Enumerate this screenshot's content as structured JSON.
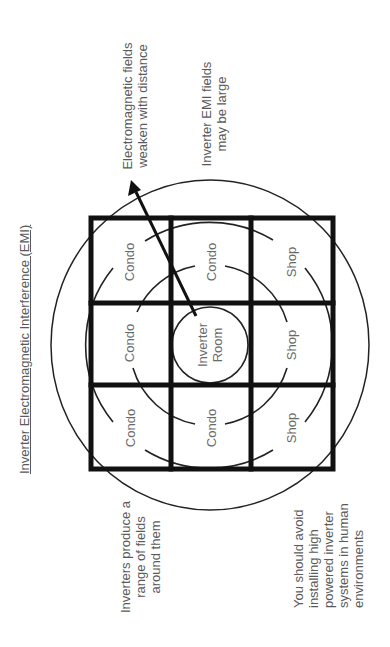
{
  "title": "Inverter Electromagnetic Interference (EMI)",
  "annotations": {
    "fields_weaken": [
      "Electromagnetic fields",
      "weaken with distance"
    ],
    "fields_large": [
      "Inverter EMI fields",
      "may be large"
    ],
    "range_of_fields": [
      "Inverters produce a",
      "range of fields",
      "around them"
    ],
    "avoid_installing": [
      "You should avoid",
      "installing high",
      "powered inverter",
      "systems in human",
      "environments"
    ]
  },
  "grid": {
    "cells": [
      {
        "row": 0,
        "col": 0,
        "label": "Condo"
      },
      {
        "row": 0,
        "col": 1,
        "label": "Condo"
      },
      {
        "row": 0,
        "col": 2,
        "label": "Shop"
      },
      {
        "row": 1,
        "col": 0,
        "label": "Condo"
      },
      {
        "row": 1,
        "col": 1,
        "label": "Inverter Room"
      },
      {
        "row": 1,
        "col": 2,
        "label": "Shop"
      },
      {
        "row": 2,
        "col": 0,
        "label": "Condo"
      },
      {
        "row": 2,
        "col": 1,
        "label": "Condo"
      },
      {
        "row": 2,
        "col": 2,
        "label": "Shop"
      }
    ],
    "center_label_lines": [
      "Inverter",
      "Room"
    ]
  },
  "colors": {
    "line": "#111111",
    "text": "#5a5a5a",
    "background": "#ffffff"
  }
}
